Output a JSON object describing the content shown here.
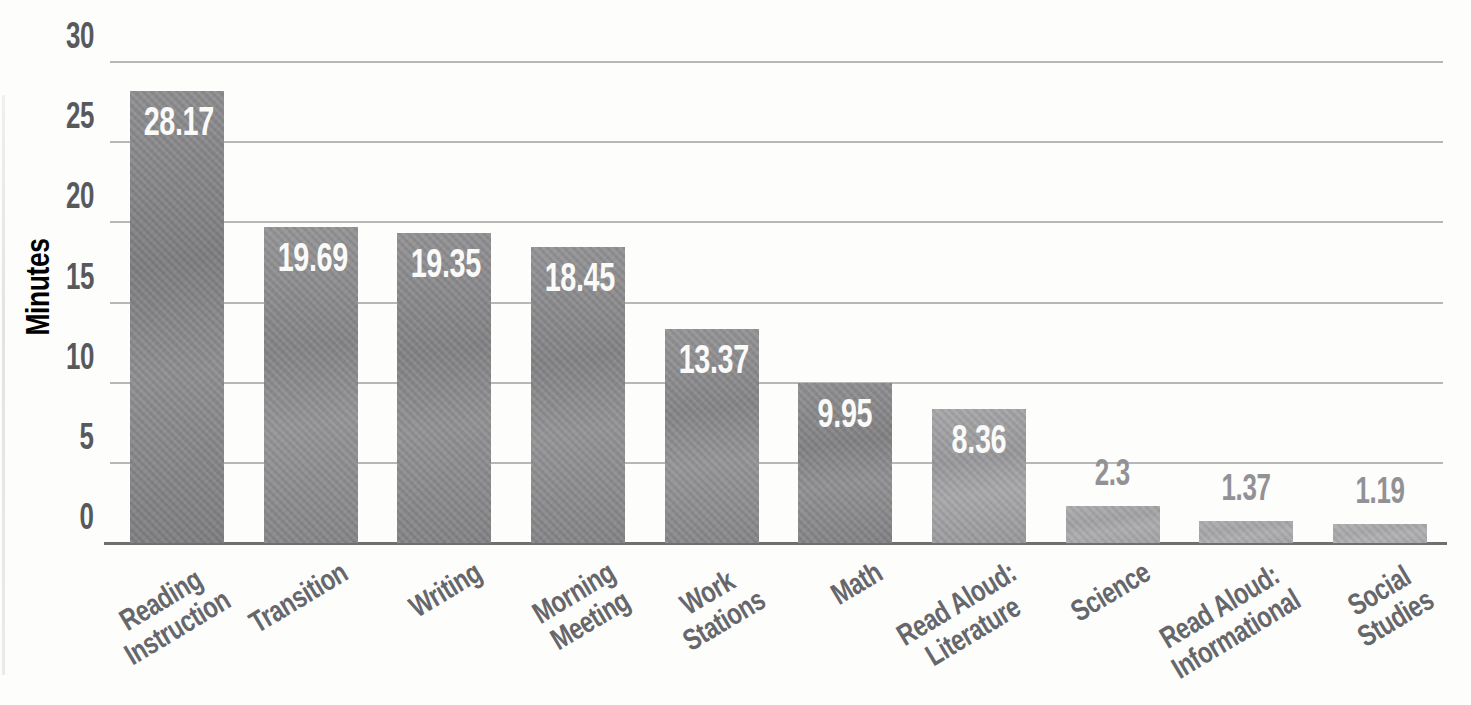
{
  "chart_data": {
    "type": "bar",
    "title": "",
    "xlabel": "",
    "ylabel": "Minutes",
    "ylim": [
      0,
      30
    ],
    "yticks": [
      0,
      5,
      10,
      15,
      20,
      25,
      30
    ],
    "grid": "horizontal",
    "legend": "none",
    "categories": [
      "Reading\nInstruction",
      "Transition",
      "Writing",
      "Morning\nMeeting",
      "Work\nStations",
      "Math",
      "Read Aloud:\nLiterature",
      "Science",
      "Read Aloud:\nInformational",
      "Social\nStudies"
    ],
    "values": [
      28.17,
      19.69,
      19.35,
      18.45,
      13.37,
      9.95,
      8.36,
      2.3,
      1.37,
      1.19
    ],
    "value_labels": [
      "28.17",
      "19.69",
      "19.35",
      "18.45",
      "13.37",
      "9.95",
      "8.36",
      "2.3",
      "1.37",
      "1.19"
    ],
    "value_label_placement": [
      "inside",
      "inside",
      "inside",
      "inside",
      "inside",
      "inside",
      "inside",
      "outside",
      "outside",
      "outside"
    ],
    "bar_colors": [
      {
        "light": "#8d8d8f",
        "dark": "#7c7c7e"
      },
      {
        "light": "#939395",
        "dark": "#838385"
      },
      {
        "light": "#909092",
        "dark": "#818183"
      },
      {
        "light": "#929294",
        "dark": "#828284"
      },
      {
        "light": "#939395",
        "dark": "#848486"
      },
      {
        "light": "#8f8f91",
        "dark": "#808082"
      },
      {
        "light": "#a6a6a8",
        "dark": "#97979a"
      },
      {
        "light": "#ababad",
        "dark": "#a1a1a3"
      },
      {
        "light": "#adadaf",
        "dark": "#a4a4a6"
      },
      {
        "light": "#afafb1",
        "dark": "#a6a6a8"
      }
    ]
  },
  "colors": {
    "background": "#fdfdfc",
    "gridline": "#a5a5a7",
    "baseline": "#6f6f72",
    "axis_text": "#58595d",
    "category_text": "#66676b",
    "value_label_inside": "#fafaf8",
    "value_label_outside": "#929296"
  }
}
